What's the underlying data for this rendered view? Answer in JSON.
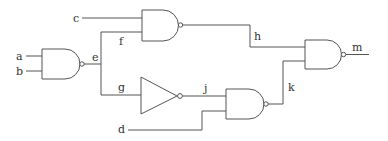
{
  "diagram": {
    "type": "logic-circuit",
    "colors": {
      "line": "#555555",
      "text": "#333333",
      "background": "#ffffff"
    },
    "labels": {
      "a": "a",
      "b": "b",
      "c": "c",
      "d": "d",
      "e": "e",
      "f": "f",
      "g": "g",
      "h": "h",
      "j": "j",
      "k": "k",
      "m": "m"
    },
    "gates": [
      {
        "id": "gate1",
        "type": "NAND",
        "inputs": [
          "a",
          "b"
        ],
        "output": "e"
      },
      {
        "id": "gate2",
        "type": "NAND",
        "inputs": [
          "c",
          "f"
        ],
        "output": "h"
      },
      {
        "id": "inverter",
        "type": "NOT",
        "inputs": [
          "g"
        ],
        "output": "j"
      },
      {
        "id": "gate3",
        "type": "NAND",
        "inputs": [
          "j",
          "d"
        ],
        "output": "k"
      },
      {
        "id": "gate4",
        "type": "NAND",
        "inputs": [
          "h",
          "k"
        ],
        "output": "m"
      }
    ],
    "junctions": [
      {
        "node": "e",
        "branches": [
          "f",
          "g"
        ]
      }
    ]
  }
}
